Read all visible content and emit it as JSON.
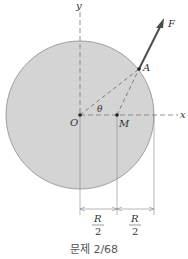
{
  "diagram": {
    "labels": {
      "y_axis": "y",
      "x_axis": "x",
      "origin": "O",
      "point_a": "A",
      "point_m": "M",
      "force": "F",
      "angle": "θ",
      "dim_left_num": "R",
      "dim_left_den": "2",
      "dim_right_num": "R",
      "dim_right_den": "2"
    },
    "colors": {
      "disk_fill": "#d4d4d4",
      "disk_stroke": "#8a8a8a",
      "line": "#777777",
      "force_arrow": "#4a4a4a"
    }
  },
  "caption": "문제 2/68"
}
